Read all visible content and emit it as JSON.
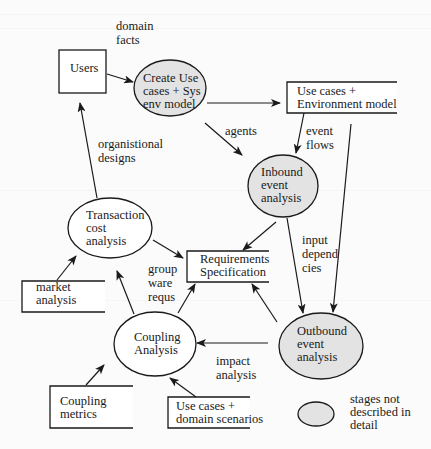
{
  "colors": {
    "background": "#fbfbfb",
    "stroke": "#1a1a1a",
    "shaded_fill": "#e3e3e3",
    "plain_fill": "#ffffff"
  },
  "nodes": {
    "users": {
      "kind": "box",
      "x": 59,
      "y": 50,
      "w": 47,
      "h": 43,
      "lines": [
        "Users"
      ],
      "tx": 70,
      "ty": 72
    },
    "create_use_cases": {
      "kind": "ellipse",
      "shaded": true,
      "cx": 170,
      "cy": 88,
      "rx": 36,
      "ry": 28,
      "lines": [
        "Create Use",
        "cases + Sys",
        "env model"
      ],
      "tx": 143,
      "ty": 82
    },
    "use_cases_env_model": {
      "kind": "store",
      "x": 287,
      "y": 82,
      "w": 110,
      "h": 31,
      "lines": [
        "Use cases +",
        "Environment model"
      ],
      "tx": 297,
      "ty": 95
    },
    "inbound": {
      "kind": "ellipse",
      "shaded": true,
      "cx": 283,
      "cy": 186,
      "rx": 35,
      "ry": 31,
      "lines": [
        "Inbound",
        "event",
        "analysis"
      ],
      "tx": 261,
      "ty": 176
    },
    "transaction": {
      "kind": "ellipse",
      "shaded": false,
      "cx": 110,
      "cy": 228,
      "rx": 42,
      "ry": 30,
      "lines": [
        "Transaction",
        "cost",
        "analysis"
      ],
      "tx": 86,
      "ty": 219
    },
    "requirements": {
      "kind": "store",
      "x": 187,
      "y": 251,
      "w": 82,
      "h": 31,
      "lines": [
        "Requirements",
        "Specification"
      ],
      "tx": 200,
      "ty": 263
    },
    "market": {
      "kind": "store",
      "x": 22,
      "y": 281,
      "w": 83,
      "h": 31,
      "lines": [
        "market",
        "analysis"
      ],
      "tx": 36,
      "ty": 291
    },
    "coupling": {
      "kind": "ellipse",
      "shaded": false,
      "cx": 155,
      "cy": 344,
      "rx": 41,
      "ry": 32,
      "lines": [
        "Coupling",
        "Analysis"
      ],
      "tx": 134,
      "ty": 341
    },
    "outbound": {
      "kind": "ellipse",
      "shaded": true,
      "cx": 321,
      "cy": 346,
      "rx": 42,
      "ry": 33,
      "lines": [
        "Outbound",
        "event",
        "analysis"
      ],
      "tx": 297,
      "ty": 335
    },
    "coupling_metrics": {
      "kind": "store",
      "x": 50,
      "y": 386,
      "w": 83,
      "h": 42,
      "lines": [
        "Coupling",
        "metrics"
      ],
      "tx": 60,
      "ty": 405
    },
    "use_cases_domain": {
      "kind": "store",
      "x": 168,
      "y": 397,
      "w": 82,
      "h": 31,
      "lines": [
        "Use cases +",
        "domain scenarios"
      ],
      "tx": 176,
      "ty": 410
    }
  },
  "edges": [
    {
      "id": "users-to-create",
      "x1": 107,
      "y1": 74,
      "x2": 133,
      "y2": 82
    },
    {
      "id": "create-to-envmodel",
      "x1": 207,
      "y1": 103,
      "x2": 280,
      "y2": 103
    },
    {
      "id": "agents",
      "x1": 205,
      "y1": 123,
      "x2": 242,
      "y2": 155
    },
    {
      "id": "event-flows",
      "x1": 304,
      "y1": 113,
      "x2": 296,
      "y2": 153
    },
    {
      "id": "envmodel-to-outbound",
      "x1": 351,
      "y1": 124,
      "x2": 333,
      "y2": 312
    },
    {
      "id": "organistional-designs",
      "x1": 97,
      "y1": 198,
      "x2": 80,
      "y2": 103
    },
    {
      "id": "inbound-to-requirements",
      "x1": 276,
      "y1": 222,
      "x2": 243,
      "y2": 250
    },
    {
      "id": "input-dependencies",
      "x1": 287,
      "y1": 218,
      "x2": 303,
      "y2": 313
    },
    {
      "id": "transaction-to-requirements",
      "x1": 153,
      "y1": 240,
      "x2": 183,
      "y2": 258
    },
    {
      "id": "market-to-transaction",
      "x1": 57,
      "y1": 280,
      "x2": 76,
      "y2": 256
    },
    {
      "id": "coupling-to-transaction",
      "x1": 134,
      "y1": 314,
      "x2": 117,
      "y2": 271
    },
    {
      "id": "groupware-requs",
      "x1": 178,
      "y1": 313,
      "x2": 195,
      "y2": 284
    },
    {
      "id": "outbound-to-requirements",
      "x1": 277,
      "y1": 322,
      "x2": 252,
      "y2": 284
    },
    {
      "id": "impact-analysis",
      "x1": 268,
      "y1": 343,
      "x2": 197,
      "y2": 343
    },
    {
      "id": "metrics-to-coupling",
      "x1": 86,
      "y1": 385,
      "x2": 104,
      "y2": 365
    },
    {
      "id": "domain-to-coupling",
      "x1": 196,
      "y1": 397,
      "x2": 170,
      "y2": 378
    }
  ],
  "edge_labels": {
    "domain_facts": {
      "lines": [
        "domain",
        "facts"
      ],
      "x": 116,
      "y": 30
    },
    "agents": {
      "lines": [
        "agents"
      ],
      "x": 225,
      "y": 135
    },
    "event_flows": {
      "lines": [
        "event",
        "flows"
      ],
      "x": 306,
      "y": 135
    },
    "organistional_designs": {
      "lines": [
        "organistional",
        "designs"
      ],
      "x": 98,
      "y": 148
    },
    "input_dependencies": {
      "lines": [
        "input",
        "depend",
        "cies"
      ],
      "x": 302,
      "y": 244
    },
    "group_ware_requs": {
      "lines": [
        "group",
        "ware",
        "requs"
      ],
      "x": 148,
      "y": 273
    },
    "impact_analysis": {
      "lines": [
        "impact",
        "analysis"
      ],
      "x": 216,
      "y": 365
    }
  },
  "legend": {
    "cx": 316,
    "cy": 414,
    "rx": 18,
    "ry": 12,
    "lines": [
      "stages not",
      "described in",
      "detail"
    ],
    "x": 350,
    "y": 403
  }
}
